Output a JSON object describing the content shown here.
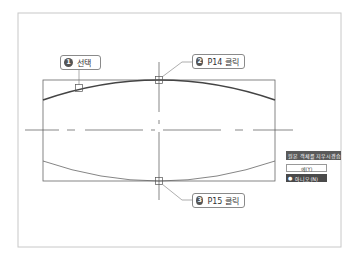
{
  "diagram": {
    "frame": {
      "x": 18,
      "y": 13,
      "w": 323,
      "h": 234,
      "color": "#c8c8c8"
    },
    "rectangle": {
      "x": 43,
      "y": 80,
      "w": 232,
      "h": 101,
      "color": "#666666"
    },
    "top_curve": {
      "x1": 43,
      "y1": 100,
      "cx": 159,
      "cy": 60,
      "x2": 275,
      "y2": 100,
      "color": "#444444",
      "width": 1.6
    },
    "bottom_curve": {
      "x1": 43,
      "y1": 161,
      "cx": 159,
      "cy": 201,
      "x2": 275,
      "y2": 161,
      "color": "#666666",
      "width": 0.8
    },
    "centerline_h": {
      "y": 130,
      "x1": 25,
      "x2": 293
    },
    "centerline_v": {
      "x": 159,
      "y1": 62,
      "y2": 200
    },
    "markers": [
      {
        "name": "select-marker",
        "x": 79,
        "y": 88
      },
      {
        "name": "p14-marker",
        "x": 159,
        "y": 80
      },
      {
        "name": "p15-marker",
        "x": 159,
        "y": 181
      }
    ]
  },
  "callouts": [
    {
      "num": "1",
      "label": "선택",
      "x": 60,
      "y": 55,
      "w": 41
    },
    {
      "num": "2",
      "label": "P14 클릭",
      "x": 192,
      "y": 54,
      "w": 53
    },
    {
      "num": "3",
      "label": "P15 클릭",
      "x": 192,
      "y": 193,
      "w": 53
    }
  ],
  "popup": {
    "header": "원본 객체를 지우시겠습니까?",
    "options": [
      {
        "label": "예(Y)",
        "selected": false
      },
      {
        "label": "아니오(N)",
        "selected": true
      }
    ],
    "bullet": "●"
  }
}
